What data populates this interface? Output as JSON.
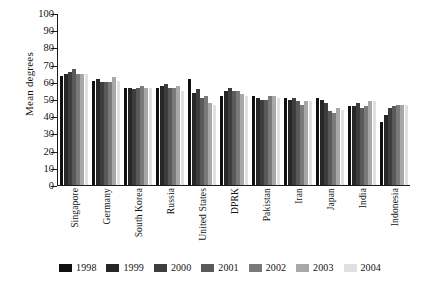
{
  "chart_data": {
    "type": "bar",
    "title": "",
    "xlabel": "",
    "ylabel": "Mean degrees",
    "ylim": [
      0,
      100
    ],
    "yticks": [
      0,
      10,
      20,
      30,
      40,
      50,
      60,
      70,
      80,
      90,
      100
    ],
    "grid": false,
    "legend_position": "bottom",
    "categories": [
      "Singapore",
      "Germany",
      "South Korea",
      "Russia",
      "United States",
      "DPRK",
      "Pakistan",
      "Iran",
      "Japan",
      "India",
      "Indonesia"
    ],
    "series": [
      {
        "name": "1998",
        "color": "#101010",
        "values": [
          64,
          61,
          57,
          57,
          62,
          52,
          52,
          51,
          51,
          46,
          37
        ]
      },
      {
        "name": "1999",
        "color": "#262626",
        "values": [
          65,
          62,
          57,
          58,
          54,
          55,
          51,
          50,
          50,
          46,
          41
        ]
      },
      {
        "name": "2000",
        "color": "#3d3d3d",
        "values": [
          66,
          60,
          56,
          59,
          56,
          57,
          50,
          51,
          48,
          48,
          45
        ]
      },
      {
        "name": "2001",
        "color": "#5a5a5a",
        "values": [
          68,
          60,
          57,
          57,
          51,
          55,
          50,
          49,
          43,
          45,
          46
        ]
      },
      {
        "name": "2002",
        "color": "#7a7a7a",
        "values": [
          65,
          60,
          58,
          57,
          52,
          55,
          52,
          47,
          42,
          46,
          47
        ]
      },
      {
        "name": "2003",
        "color": "#a8a8a8",
        "values": [
          65,
          63,
          57,
          58,
          48,
          53,
          52,
          49,
          45,
          49,
          47
        ]
      },
      {
        "name": "2004",
        "color": "#e0e0e0",
        "values": [
          65,
          61,
          57,
          55,
          47,
          52,
          51,
          49,
          44,
          49,
          47
        ]
      }
    ]
  }
}
